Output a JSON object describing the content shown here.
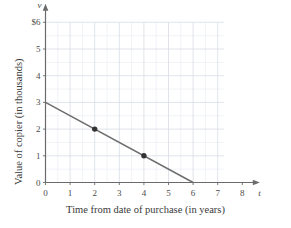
{
  "chart_data": {
    "type": "line",
    "title": "",
    "xlabel": "Time from date of purchase (in years)",
    "ylabel": "Value of copier (in thousands)",
    "x_variable": "t",
    "y_variable": "v",
    "xlim": [
      0,
      8
    ],
    "ylim": [
      0,
      6
    ],
    "xticks": [
      "0",
      "1",
      "2",
      "3",
      "4",
      "5",
      "6",
      "7",
      "8"
    ],
    "xtick_values": [
      0,
      1,
      2,
      3,
      4,
      5,
      6,
      7,
      8
    ],
    "yticks": [
      "0",
      "1",
      "2",
      "3",
      "4",
      "5",
      "$6"
    ],
    "ytick_values": [
      0,
      1,
      2,
      3,
      4,
      5,
      6
    ],
    "grid": true,
    "grid_minor_step": 0.5,
    "grid_x_extent": [
      0,
      7.25
    ],
    "grid_y_extent": [
      0,
      6
    ],
    "legend": "none",
    "series": [
      {
        "name": "Value of copier",
        "type": "line",
        "x": [
          0,
          6
        ],
        "values": [
          3,
          0
        ],
        "color": "#6e6e6e",
        "equation": "v = 3 - 0.5t"
      }
    ],
    "markers": [
      {
        "label": "(2, 2)",
        "x": 2,
        "y": 2,
        "color": "#333333"
      },
      {
        "label": "(4, 1)",
        "x": 4,
        "y": 1,
        "color": "#333333"
      }
    ],
    "axis_arrows": {
      "x": true,
      "y": true
    },
    "colors": {
      "line": "#6e6e6e",
      "marker": "#333333",
      "axis": "#6b6b6b",
      "grid_major": "#d8dce4",
      "grid_minor": "#ebeef3",
      "text": "#3a3a3a",
      "background": "#ffffff"
    }
  }
}
